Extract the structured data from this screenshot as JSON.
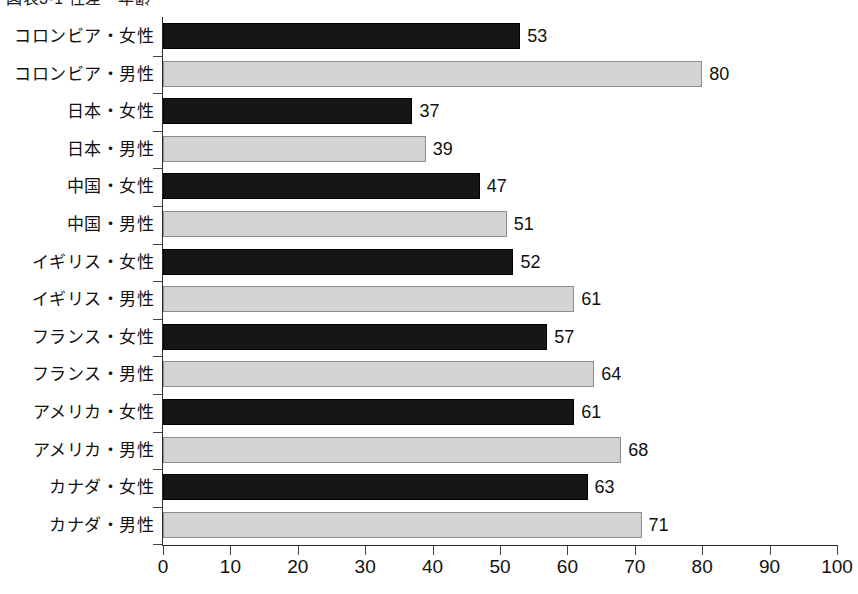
{
  "chart_data": {
    "type": "bar",
    "orientation": "horizontal",
    "title": "図表3-1 性差・年齢",
    "xlabel": "",
    "ylabel": "",
    "xlim": [
      0,
      100
    ],
    "xticks": [
      0,
      10,
      20,
      30,
      40,
      50,
      60,
      70,
      80,
      90,
      100
    ],
    "grid": false,
    "legend": null,
    "categories": [
      "コロンビア・女性",
      "コロンビア・男性",
      "日本・女性",
      "日本・男性",
      "中国・女性",
      "中国・男性",
      "イギリス・女性",
      "イギリス・男性",
      "フランス・女性",
      "フランス・男性",
      "アメリカ・女性",
      "アメリカ・男性",
      "カナダ・女性",
      "カナダ・男性"
    ],
    "values": [
      53,
      80,
      37,
      39,
      47,
      51,
      52,
      61,
      57,
      64,
      61,
      68,
      63,
      71
    ],
    "bar_styles": [
      "dark",
      "light",
      "dark",
      "light",
      "dark",
      "light",
      "dark",
      "light",
      "dark",
      "light",
      "dark",
      "light",
      "dark",
      "light"
    ],
    "colors": {
      "dark_bar": "#161616",
      "light_bar": "#d4d4d4",
      "light_bar_border": "#8c8c8c",
      "axis": "#2b2b2b",
      "text": "#111111",
      "background": "#ffffff"
    }
  }
}
